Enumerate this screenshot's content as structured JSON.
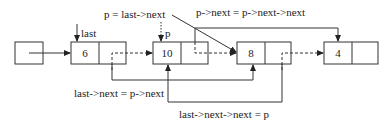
{
  "diagram": {
    "type": "linked-list-deletion",
    "nodes": [
      {
        "id": "head",
        "value": ""
      },
      {
        "id": "n6",
        "value": "6"
      },
      {
        "id": "n10",
        "value": "10"
      },
      {
        "id": "n8",
        "value": "8"
      },
      {
        "id": "n4",
        "value": "4"
      }
    ],
    "pointer_labels": {
      "last": "last",
      "p": "p"
    },
    "annotations": {
      "p_assign": "p = last->next",
      "p_next_assign": "p->next = p->next->next",
      "last_next_assign": "last->next = p->next",
      "last_next_next_assign": "last->next->next = p"
    },
    "edges": [
      {
        "from": "head",
        "to": "n6",
        "style": "solid"
      },
      {
        "from": "n6",
        "to": "n10",
        "style": "dashed"
      },
      {
        "from": "n10",
        "to": "n8",
        "style": "dashed"
      },
      {
        "from": "n8",
        "to": "n4",
        "style": "dashed"
      },
      {
        "from": "n10",
        "to": "n4",
        "style": "solid",
        "label": "p->next = p->next->next"
      },
      {
        "from": "n6",
        "to": "n8",
        "style": "solid",
        "label": "last->next = p->next"
      },
      {
        "from": "n8",
        "to": "n10",
        "style": "solid",
        "label": "last->next->next = p"
      }
    ]
  }
}
